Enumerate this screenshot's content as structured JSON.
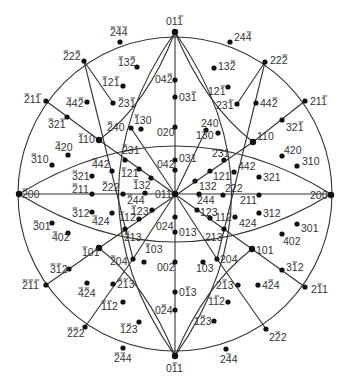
{
  "diagram": {
    "title": "",
    "type": "stereographic-projection",
    "center": [
      175,
      194
    ],
    "radius": 157,
    "colors": {
      "line": "#333333",
      "point": "#111111",
      "label": "#333333",
      "background": "#ffffff"
    },
    "notation": "A '-' before a digit means that digit is overbarred (negative index)."
  },
  "points": [
    {
      "id": "01-1_top",
      "label": "01-1",
      "x": 175,
      "y": 32,
      "lx": 166,
      "ly": 25,
      "anchor": "middle",
      "pole": true
    },
    {
      "id": "-24-4",
      "label": "-2-4-4",
      "x": 120,
      "y": 42,
      "lx": 110,
      "ly": 36,
      "anchor": "start"
    },
    {
      "id": "24-4",
      "label": "24-4",
      "x": 230,
      "y": 42,
      "lx": 234,
      "ly": 41,
      "anchor": "start"
    },
    {
      "id": "-22-2",
      "label": "-22-2",
      "x": 84,
      "y": 61,
      "lx": 63,
      "ly": 60,
      "anchor": "start"
    },
    {
      "id": "22-2",
      "label": "22-2",
      "x": 265,
      "y": 62,
      "lx": 270,
      "ly": 64,
      "anchor": "start"
    },
    {
      "id": "-13-2",
      "label": "-13-2",
      "x": 137,
      "y": 67,
      "lx": 118,
      "ly": 66,
      "anchor": "start"
    },
    {
      "id": "13-2",
      "label": "13-2",
      "x": 214,
      "y": 68,
      "lx": 218,
      "ly": 70,
      "anchor": "start"
    },
    {
      "id": "04-2",
      "label": "04-2",
      "x": 175,
      "y": 80,
      "lx": 155,
      "ly": 83,
      "anchor": "start"
    },
    {
      "id": "-12-1",
      "label": "-12-1",
      "x": 123,
      "y": 86,
      "lx": 102,
      "ly": 86,
      "anchor": "start"
    },
    {
      "id": "12-1",
      "label": "12-1",
      "x": 228,
      "y": 87,
      "lx": 208,
      "ly": 95,
      "anchor": "start"
    },
    {
      "id": "03-1",
      "label": "03-1",
      "x": 175,
      "y": 97,
      "lx": 179,
      "ly": 101,
      "anchor": "start"
    },
    {
      "id": "-21-1",
      "label": "-21-1",
      "x": 46,
      "y": 101,
      "lx": 24,
      "ly": 103,
      "anchor": "start"
    },
    {
      "id": "21-1",
      "label": "21-1",
      "x": 305,
      "y": 101,
      "lx": 310,
      "ly": 105,
      "anchor": "start"
    },
    {
      "id": "-4-4-2",
      "label": "-44-2",
      "x": 87,
      "y": 102,
      "lx": 66,
      "ly": 107,
      "anchor": "start"
    },
    {
      "id": "44-2",
      "label": "44-2",
      "x": 256,
      "y": 103,
      "lx": 260,
      "ly": 107,
      "anchor": "start"
    },
    {
      "id": "-23-1",
      "label": "-23-1",
      "x": 113,
      "y": 103,
      "lx": 118,
      "ly": 107,
      "anchor": "start"
    },
    {
      "id": "23-1",
      "label": "23-1",
      "x": 237,
      "y": 104,
      "lx": 216,
      "ly": 109,
      "anchor": "start"
    },
    {
      "id": "-32-1",
      "label": "-32-1",
      "x": 67,
      "y": 117,
      "lx": 48,
      "ly": 128,
      "anchor": "start"
    },
    {
      "id": "32-1",
      "label": "32-1",
      "x": 282,
      "y": 120,
      "lx": 286,
      "ly": 131,
      "anchor": "start"
    },
    {
      "id": "-130",
      "label": "-130",
      "x": 141,
      "y": 129,
      "lx": 134,
      "ly": 124,
      "anchor": "start"
    },
    {
      "id": "-240",
      "label": "-240",
      "x": 131,
      "y": 128,
      "lx": 107,
      "ly": 131,
      "anchor": "start"
    },
    {
      "id": "240",
      "label": "240",
      "x": 206,
      "y": 130,
      "lx": 201,
      "ly": 127,
      "anchor": "start"
    },
    {
      "id": "130",
      "label": "130",
      "x": 218,
      "y": 133,
      "lx": 196,
      "ly": 139,
      "anchor": "start"
    },
    {
      "id": "020",
      "label": "020",
      "x": 175,
      "y": 127,
      "lx": 157,
      "ly": 136,
      "anchor": "start"
    },
    {
      "id": "-110",
      "label": "-110",
      "x": 99,
      "y": 140,
      "lx": 78,
      "ly": 143,
      "anchor": "start",
      "pole": true
    },
    {
      "id": "110",
      "label": "110",
      "x": 253,
      "y": 142,
      "lx": 257,
      "ly": 140,
      "anchor": "start",
      "pole": true
    },
    {
      "id": "-420",
      "label": "-420",
      "x": 68,
      "y": 155,
      "lx": 55,
      "ly": 151,
      "anchor": "start"
    },
    {
      "id": "420",
      "label": "420",
      "x": 282,
      "y": 156,
      "lx": 284,
      "ly": 154,
      "anchor": "start"
    },
    {
      "id": "-310",
      "label": "-310",
      "x": 52,
      "y": 165,
      "lx": 31,
      "ly": 163,
      "anchor": "start"
    },
    {
      "id": "310",
      "label": "310",
      "x": 297,
      "y": 166,
      "lx": 302,
      "ly": 165,
      "anchor": "start"
    },
    {
      "id": "-231",
      "label": "-231",
      "x": 125,
      "y": 160,
      "lx": 122,
      "ly": 154,
      "anchor": "start"
    },
    {
      "id": "231",
      "label": "231",
      "x": 224,
      "y": 160,
      "lx": 212,
      "ly": 157,
      "anchor": "start"
    },
    {
      "id": "031",
      "label": "031",
      "x": 175,
      "y": 160,
      "lx": 179,
      "ly": 162,
      "anchor": "start"
    },
    {
      "id": "042",
      "label": "042",
      "x": 175,
      "y": 170,
      "lx": 157,
      "ly": 168,
      "anchor": "start"
    },
    {
      "id": "-442",
      "label": "-442",
      "x": 112,
      "y": 171,
      "lx": 92,
      "ly": 168,
      "anchor": "start"
    },
    {
      "id": "442",
      "label": "442",
      "x": 234,
      "y": 172,
      "lx": 238,
      "ly": 170,
      "anchor": "start"
    },
    {
      "id": "-121",
      "label": "-121",
      "x": 139,
      "y": 169,
      "lx": 121,
      "ly": 177,
      "anchor": "start"
    },
    {
      "id": "121",
      "label": "121",
      "x": 210,
      "y": 171,
      "lx": 213,
      "ly": 180,
      "anchor": "start"
    },
    {
      "id": "-321",
      "label": "-321",
      "x": 92,
      "y": 176,
      "lx": 72,
      "ly": 180,
      "anchor": "start"
    },
    {
      "id": "321",
      "label": "321",
      "x": 259,
      "y": 177,
      "lx": 263,
      "ly": 181,
      "anchor": "start"
    },
    {
      "id": "-132",
      "label": "-132",
      "x": 151,
      "y": 178,
      "lx": 133,
      "ly": 189,
      "anchor": "start"
    },
    {
      "id": "132",
      "label": "132",
      "x": 195,
      "y": 181,
      "lx": 199,
      "ly": 190,
      "anchor": "start"
    },
    {
      "id": "-200",
      "label": "-200",
      "x": 19,
      "y": 194,
      "lx": 22,
      "ly": 198,
      "anchor": "start",
      "pole": true
    },
    {
      "id": "200",
      "label": "200",
      "x": 331,
      "y": 195,
      "lx": 310,
      "ly": 199,
      "anchor": "start",
      "pole": true
    },
    {
      "id": "-211",
      "label": "-211",
      "x": 92,
      "y": 194,
      "lx": 72,
      "ly": 193,
      "anchor": "start"
    },
    {
      "id": "211",
      "label": "211",
      "x": 259,
      "y": 195,
      "lx": 240,
      "ly": 204,
      "anchor": "start"
    },
    {
      "id": "-222",
      "label": "-222",
      "x": 123,
      "y": 194,
      "lx": 102,
      "ly": 191,
      "anchor": "start"
    },
    {
      "id": "222",
      "label": "222",
      "x": 223,
      "y": 195,
      "lx": 225,
      "ly": 192,
      "anchor": "start"
    },
    {
      "id": "011_center",
      "label": "011",
      "x": 175,
      "y": 194,
      "lx": 155,
      "ly": 198,
      "anchor": "start",
      "pole": true
    },
    {
      "id": "-244",
      "label": "-244",
      "x": 145,
      "y": 193,
      "lx": 127,
      "ly": 204,
      "anchor": "start"
    },
    {
      "id": "244",
      "label": "244",
      "x": 199,
      "y": 194,
      "lx": 197,
      "ly": 204,
      "anchor": "start"
    },
    {
      "id": "-123",
      "label": "-123",
      "x": 152,
      "y": 210,
      "lx": 131,
      "ly": 215,
      "anchor": "start"
    },
    {
      "id": "123",
      "label": "123",
      "x": 197,
      "y": 210,
      "lx": 200,
      "ly": 216,
      "anchor": "start"
    },
    {
      "id": "-312",
      "label": "-312",
      "x": 92,
      "y": 212,
      "lx": 72,
      "ly": 217,
      "anchor": "start"
    },
    {
      "id": "312",
      "label": "312",
      "x": 259,
      "y": 213,
      "lx": 263,
      "ly": 217,
      "anchor": "start"
    },
    {
      "id": "-112",
      "label": "-112",
      "x": 139,
      "y": 219,
      "lx": 119,
      "ly": 221,
      "anchor": "start"
    },
    {
      "id": "112",
      "label": "112",
      "x": 235,
      "y": 217,
      "lx": 215,
      "ly": 221,
      "anchor": "start"
    },
    {
      "id": "-424",
      "label": "-424",
      "x": 112,
      "y": 213,
      "lx": 92,
      "ly": 225,
      "anchor": "start"
    },
    {
      "id": "424",
      "label": "424",
      "x": 210,
      "y": 218,
      "lx": 239,
      "ly": 227,
      "anchor": "start"
    },
    {
      "id": "024",
      "label": "024",
      "x": 175,
      "y": 217,
      "lx": 156,
      "ly": 230,
      "anchor": "start"
    },
    {
      "id": "013",
      "label": "013",
      "x": 175,
      "y": 232,
      "lx": 179,
      "ly": 236,
      "anchor": "start"
    },
    {
      "id": "-213",
      "label": "-213",
      "x": 125,
      "y": 229,
      "lx": 124,
      "ly": 241,
      "anchor": "start"
    },
    {
      "id": "213",
      "label": "213",
      "x": 224,
      "y": 229,
      "lx": 205,
      "ly": 241,
      "anchor": "start"
    },
    {
      "id": "-301",
      "label": "-301",
      "x": 52,
      "y": 223,
      "lx": 33,
      "ly": 230,
      "anchor": "start"
    },
    {
      "id": "301",
      "label": "301",
      "x": 297,
      "y": 224,
      "lx": 301,
      "ly": 232,
      "anchor": "start"
    },
    {
      "id": "-402",
      "label": "-402",
      "x": 68,
      "y": 233,
      "lx": 52,
      "ly": 241,
      "anchor": "start"
    },
    {
      "id": "402",
      "label": "402",
      "x": 282,
      "y": 234,
      "lx": 283,
      "ly": 245,
      "anchor": "start"
    },
    {
      "id": "-101",
      "label": "-101",
      "x": 99,
      "y": 248,
      "lx": 82,
      "ly": 256,
      "anchor": "start",
      "pole": true
    },
    {
      "id": "101",
      "label": "101",
      "x": 252,
      "y": 249,
      "lx": 256,
      "ly": 254,
      "anchor": "start",
      "pole": true
    },
    {
      "id": "-204",
      "label": "-204",
      "x": 133,
      "y": 259,
      "lx": 110,
      "ly": 265,
      "anchor": "start"
    },
    {
      "id": "204",
      "label": "204",
      "x": 217,
      "y": 259,
      "lx": 220,
      "ly": 263,
      "anchor": "start"
    },
    {
      "id": "-103",
      "label": "-103",
      "x": 144,
      "y": 262,
      "lx": 145,
      "ly": 253,
      "anchor": "start"
    },
    {
      "id": "103",
      "label": "103",
      "x": 203,
      "y": 262,
      "lx": 196,
      "ly": 272,
      "anchor": "start"
    },
    {
      "id": "002",
      "label": "002",
      "x": 175,
      "y": 262,
      "lx": 157,
      "ly": 271,
      "anchor": "start"
    },
    {
      "id": "-3-12",
      "label": "-3-12",
      "x": 69,
      "y": 269,
      "lx": 50,
      "ly": 273,
      "anchor": "start"
    },
    {
      "id": "3-12",
      "label": "3-12",
      "x": 282,
      "y": 270,
      "lx": 286,
      "ly": 271,
      "anchor": "start"
    },
    {
      "id": "-2-1-1",
      "label": "-2-1-1",
      "x": 46,
      "y": 285,
      "lx": 22,
      "ly": 289,
      "anchor": "start"
    },
    {
      "id": "2-11",
      "label": "2-11",
      "x": 305,
      "y": 287,
      "lx": 311,
      "ly": 293,
      "anchor": "start"
    },
    {
      "id": "-4-24",
      "label": "-4-24",
      "x": 87,
      "y": 283,
      "lx": 78,
      "ly": 297,
      "anchor": "start"
    },
    {
      "id": "4-24",
      "label": "4-24",
      "x": 258,
      "y": 285,
      "lx": 262,
      "ly": 289,
      "anchor": "start"
    },
    {
      "id": "-2-13",
      "label": "-2-13",
      "x": 113,
      "y": 284,
      "lx": 117,
      "ly": 288,
      "anchor": "start"
    },
    {
      "id": "2-13",
      "label": "2-13",
      "x": 238,
      "y": 285,
      "lx": 216,
      "ly": 289,
      "anchor": "start"
    },
    {
      "id": "0-13",
      "label": "0-13",
      "x": 175,
      "y": 292,
      "lx": 179,
      "ly": 296,
      "anchor": "start"
    },
    {
      "id": "-1-12",
      "label": "-1-12",
      "x": 123,
      "y": 302,
      "lx": 101,
      "ly": 310,
      "anchor": "start"
    },
    {
      "id": "1-12",
      "label": "1-12",
      "x": 228,
      "y": 302,
      "lx": 208,
      "ly": 305,
      "anchor": "start"
    },
    {
      "id": "0-24",
      "label": "0-24",
      "x": 175,
      "y": 310,
      "lx": 155,
      "ly": 314,
      "anchor": "start"
    },
    {
      "id": "-1-23",
      "label": "-1-23",
      "x": 139,
      "y": 322,
      "lx": 120,
      "ly": 333,
      "anchor": "start"
    },
    {
      "id": "1-23",
      "label": "1-23",
      "x": 214,
      "y": 321,
      "lx": 194,
      "ly": 325,
      "anchor": "start"
    },
    {
      "id": "-2-22",
      "label": "-2-22",
      "x": 85,
      "y": 327,
      "lx": 67,
      "ly": 337,
      "anchor": "start"
    },
    {
      "id": "2-22",
      "label": "2-22",
      "x": 266,
      "y": 329,
      "lx": 269,
      "ly": 341,
      "anchor": "start"
    },
    {
      "id": "-2-44",
      "label": "-2-44",
      "x": 123,
      "y": 348,
      "lx": 114,
      "ly": 362,
      "anchor": "start"
    },
    {
      "id": "2-44",
      "label": "2-44",
      "x": 226,
      "y": 349,
      "lx": 220,
      "ly": 363,
      "anchor": "start"
    },
    {
      "id": "0-11_bottom",
      "label": "0-11",
      "x": 175,
      "y": 356,
      "lx": 166,
      "ly": 372,
      "anchor": "start",
      "pole": true
    }
  ],
  "lines": [
    {
      "name": "primitive-circle",
      "type": "circle",
      "cx": 175,
      "cy": 194,
      "r": 157
    },
    {
      "name": "vertical-zone",
      "type": "line",
      "x1": 175,
      "y1": 32,
      "x2": 175,
      "y2": 356
    },
    {
      "name": "horizontal-zone",
      "type": "line",
      "x1": 19,
      "y1": 194,
      "x2": 331,
      "y2": 194
    },
    {
      "name": "great-circle-top",
      "type": "path",
      "d": "M19,194 Q175,98 331,194"
    },
    {
      "name": "great-circle-bottom",
      "type": "path",
      "d": "M19,194 Q175,290 331,194"
    },
    {
      "name": "great-circle-left",
      "type": "path",
      "d": "M175,32 Q62,194 175,356"
    },
    {
      "name": "great-circle-right",
      "type": "path",
      "d": "M175,32 Q288,194 175,356"
    },
    {
      "name": "arc-011-to-110",
      "type": "path",
      "d": "M175,32 Q205,105 253,142"
    },
    {
      "name": "arc-011-to-m110",
      "type": "path",
      "d": "M175,32 Q147,105 99,140"
    },
    {
      "name": "arc-0m11-to-101",
      "type": "path",
      "d": "M175,356 Q205,285 252,249"
    },
    {
      "name": "arc-0m11-to-m101",
      "type": "path",
      "d": "M175,356 Q147,285 99,248"
    },
    {
      "name": "diag-m110-to-101",
      "type": "line",
      "x1": 99,
      "y1": 140,
      "x2": 252,
      "y2": 249
    },
    {
      "name": "diag-110-to-m101",
      "type": "line",
      "x1": 253,
      "y1": 142,
      "x2": 99,
      "y2": 248
    },
    {
      "name": "diag-m22m2-to-m101",
      "type": "line",
      "x1": 84,
      "y1": 61,
      "x2": 133,
      "y2": 259
    },
    {
      "name": "diag-22m2-to-101",
      "type": "line",
      "x1": 265,
      "y1": 62,
      "x2": 217,
      "y2": 259
    },
    {
      "name": "line-m21m1-to-m110",
      "type": "line",
      "x1": 46,
      "y1": 101,
      "x2": 99,
      "y2": 140
    },
    {
      "name": "line-21m1-to-110",
      "type": "line",
      "x1": 305,
      "y1": 101,
      "x2": 253,
      "y2": 142
    },
    {
      "name": "line-m2m1m1-to-m101",
      "type": "line",
      "x1": 46,
      "y1": 285,
      "x2": 99,
      "y2": 248
    },
    {
      "name": "line-2m11-to-101",
      "type": "line",
      "x1": 305,
      "y1": 287,
      "x2": 252,
      "y2": 249
    },
    {
      "name": "line-m2m22-to-m101",
      "type": "line",
      "x1": 85,
      "y1": 327,
      "x2": 133,
      "y2": 259
    },
    {
      "name": "line-2m22-to-101",
      "type": "line",
      "x1": 266,
      "y1": 329,
      "x2": 217,
      "y2": 259
    },
    {
      "name": "line-m22m2-to-m23m1",
      "type": "line",
      "x1": 84,
      "y1": 61,
      "x2": 113,
      "y2": 103
    },
    {
      "name": "line-22m2-to-23m1",
      "type": "line",
      "x1": 265,
      "y1": 62,
      "x2": 237,
      "y2": 104
    },
    {
      "name": "line-m240-center",
      "type": "line",
      "x1": 131,
      "y1": 128,
      "x2": 175,
      "y2": 194
    },
    {
      "name": "line-240-center",
      "type": "line",
      "x1": 206,
      "y1": 130,
      "x2": 175,
      "y2": 194
    },
    {
      "name": "line-m204-center",
      "type": "line",
      "x1": 133,
      "y1": 259,
      "x2": 175,
      "y2": 194
    },
    {
      "name": "line-204-center",
      "type": "line",
      "x1": 217,
      "y1": 259,
      "x2": 175,
      "y2": 194
    }
  ]
}
